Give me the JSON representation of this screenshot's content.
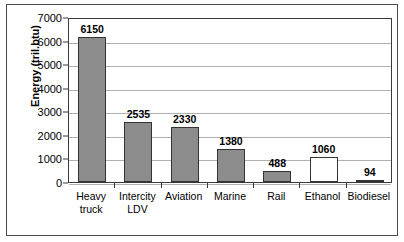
{
  "chart_data": {
    "type": "bar",
    "title": "",
    "xlabel": "",
    "ylabel": "Energy (tril.btu)",
    "ylim": [
      0,
      7000
    ],
    "ytick_labels": [
      "0",
      "1000",
      "2000",
      "3000",
      "4000",
      "5000",
      "6000",
      "7000"
    ],
    "ytick_values": [
      0,
      1000,
      2000,
      3000,
      4000,
      5000,
      6000,
      7000
    ],
    "grid": true,
    "legend": "none",
    "categories": [
      "Heavy\ntruck",
      "Intercity\nLDV",
      "Aviation",
      "Marine",
      "Rail",
      "Ethanol",
      "Biodiesel"
    ],
    "values": [
      6150,
      2535,
      2330,
      1380,
      488,
      1060,
      94
    ],
    "value_labels": [
      "6150",
      "2535",
      "2330",
      "1380",
      "488",
      "1060",
      "94"
    ],
    "bar_fills": [
      "#8c8c8c",
      "#8c8c8c",
      "#8c8c8c",
      "#8c8c8c",
      "#8c8c8c",
      "#ffffff",
      "#ffffff"
    ],
    "bar_edge_color": "#333333",
    "grid_color": "#b0b0b0",
    "axis_color": "#3a3a3a",
    "background_color": "#ffffff"
  }
}
